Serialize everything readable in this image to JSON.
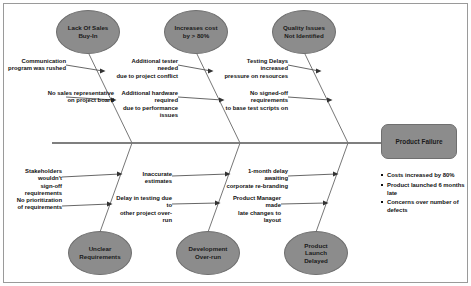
{
  "diagram": {
    "type": "fishbone",
    "effect": {
      "label": "Product Failure"
    },
    "top_categories": [
      {
        "label": "Lack Of Sales\nBuy-In"
      },
      {
        "label": "Increases cost\nby > 80%"
      },
      {
        "label": "Quality Issues\nNot Identified"
      }
    ],
    "bottom_categories": [
      {
        "label": "Unclear\nRequirements"
      },
      {
        "label": "Development\nOver-run"
      },
      {
        "label": "Product\nLaunch\nDelayed"
      }
    ],
    "causes": [
      {
        "line1": "Communication",
        "line2": "program was rushed"
      },
      {
        "line1": "No sales representative",
        "line2": "on project board"
      },
      {
        "line1": "Additional tester needed",
        "line2": "due to project conflict"
      },
      {
        "line1": "Additional hardware required",
        "line2": "due to performance issues"
      },
      {
        "line1": "Testing Delays increased",
        "line2": "pressure on resources"
      },
      {
        "line1": "No signed-off requirements",
        "line2": "to base test scripts on"
      },
      {
        "line1": "Stakeholders wouldn't",
        "line2": "sign-off requirements"
      },
      {
        "line1": "No prioritization",
        "line2": "of requirements"
      },
      {
        "line1": "Inaccurate estimates",
        "line2": ""
      },
      {
        "line1": "Delay in testing due to",
        "line2": "other project over-run"
      },
      {
        "line1": "1-month delay awaiting",
        "line2": "corporate re-branding"
      },
      {
        "line1": "Product Manager made",
        "line2": "late changes to layout"
      }
    ],
    "outcomes": [
      "Costs increased by 80%",
      "Product launched 6 months late",
      "Concerns over number of defects"
    ],
    "colors": {
      "node_fill": "#8c8c8c",
      "node_stroke": "#6f6f6f",
      "line": "#555555",
      "text": "#111111"
    }
  }
}
